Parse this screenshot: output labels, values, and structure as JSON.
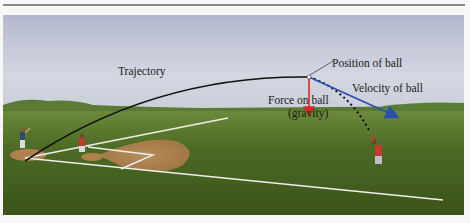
{
  "figure": {
    "type": "physics-diagram",
    "labels": {
      "trajectory": "Trajectory",
      "position": "Position of ball",
      "velocity": "Velocity of ball",
      "force_line1": "Force on ball",
      "force_line2": "(gravity)"
    },
    "colors": {
      "sky_top": "#b9bed0",
      "sky_bottom": "#d9dbe6",
      "grass_dark": "#3e5a1c",
      "grass_light": "#5b7a2a",
      "dirt": "#b98a55",
      "trajectory": "#111111",
      "force_arrow": "#d42a2a",
      "velocity_arrow": "#2a4fb0",
      "chalk": "#f2f2ee"
    }
  }
}
